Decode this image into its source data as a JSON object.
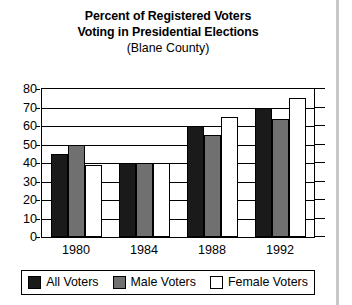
{
  "chart_data": {
    "type": "bar",
    "title": "Percent of Registered Voters Voting in Presidential Elections",
    "title_lines": [
      "Percent of Registered Voters",
      "Voting in Presidential Elections"
    ],
    "subtitle": "(Blane County)",
    "xlabel": "",
    "ylabel": "",
    "ylim": [
      0,
      80
    ],
    "ytick_step": 10,
    "yticks": [
      0,
      10,
      20,
      30,
      40,
      50,
      60,
      70,
      80
    ],
    "ytick_labels": [
      "0",
      "10",
      "20",
      "30",
      "40",
      "50",
      "60",
      "70",
      "80"
    ],
    "grid": true,
    "grid_axis": "y",
    "legend_position": "bottom",
    "categories": [
      "1980",
      "1984",
      "1988",
      "1992"
    ],
    "series": [
      {
        "name": "All Voters",
        "color": "#1a1a1a",
        "values": [
          45,
          40,
          60,
          70
        ]
      },
      {
        "name": "Male Voters",
        "color": "#707070",
        "values": [
          50,
          40,
          55,
          64
        ]
      },
      {
        "name": "Female Voters",
        "color": "#ffffff",
        "values": [
          39,
          40,
          65,
          75
        ]
      }
    ]
  },
  "colors": {
    "all_voters": "#1a1a1a",
    "male_voters": "#707070",
    "female_voters": "#ffffff",
    "axis": "#000000",
    "background": "#ffffff",
    "edge_band": "#c8c8c8"
  },
  "legend": {
    "entries": [
      {
        "label": "All Voters",
        "swatch": "black-swatch-icon"
      },
      {
        "label": "Male Voters",
        "swatch": "gray-swatch-icon"
      },
      {
        "label": "Female Voters",
        "swatch": "white-swatch-icon"
      }
    ]
  }
}
